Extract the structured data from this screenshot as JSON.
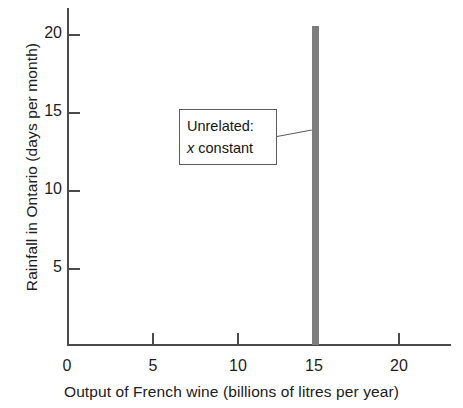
{
  "chart_data": {
    "type": "bar",
    "title": "",
    "xlabel": "Output of French wine (billions of litres per year)",
    "ylabel": "Rainfall in Ontario (days per month)",
    "xlim": [
      0,
      22.6
    ],
    "ylim": [
      0,
      21.6
    ],
    "xticks": [
      0,
      5,
      10,
      15,
      20
    ],
    "xtick_labels": [
      "0",
      "5",
      "10",
      "15",
      "20"
    ],
    "yticks": [
      5,
      10,
      15,
      20
    ],
    "ytick_labels": [
      "5",
      "10",
      "15",
      "20"
    ],
    "grid": false,
    "legend": null,
    "categories": [
      15
    ],
    "values": [
      20.5
    ],
    "series": [
      {
        "name": "x constant",
        "x": [
          15
        ],
        "values": [
          20.5
        ],
        "color": "#7d7d7d",
        "bar_width": 0.2
      }
    ],
    "annotations": [
      {
        "name": "unrelated-callout",
        "lines": [
          "Unrelated:",
          "x constant"
        ],
        "points_to_x": 15,
        "points_to_y": 13.8
      }
    ]
  },
  "annotation": {
    "line1": "Unrelated:",
    "line2": "x constant"
  },
  "colors": {
    "bar": "#7d7d7d",
    "axis": "#4a4a4a",
    "text": "#1a1a1a",
    "box_border": "#5c5c5c",
    "background": "#ffffff"
  }
}
